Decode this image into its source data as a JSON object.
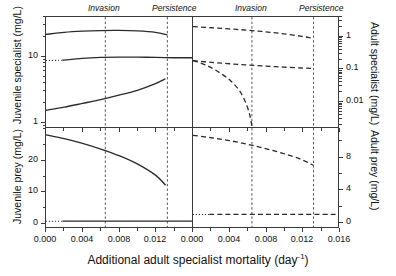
{
  "chart_data": {
    "type": "line",
    "title": "",
    "xlabel": "Additional adult specialist mortality (day−1)",
    "xlabel_base": "Additional adult specialist mortality (day",
    "xlabel_sup": "-1",
    "xlabel_tail": ")",
    "panels": [
      {
        "id": "top-left",
        "ylabel": "Juvenile specialist (mg/L)",
        "yscale": "log",
        "ylim": [
          0.8,
          40
        ],
        "yticks": [
          1,
          10
        ],
        "yticklabels": [
          "1",
          "10"
        ],
        "xlim": [
          0.0,
          0.016
        ],
        "xticks": [
          0.0,
          0.004,
          0.008,
          0.012
        ],
        "xticklabels": [
          "0.000",
          "0.004",
          "0.008",
          "0.012"
        ],
        "grid": false,
        "linestyle": "solid",
        "series": [
          {
            "name": "upper-branch",
            "style": "solid",
            "x": [
              0.0,
              0.002,
              0.004,
              0.006,
              0.008,
              0.01,
              0.012,
              0.0133
            ],
            "y": [
              21.5,
              23.2,
              24.2,
              24.7,
              24.8,
              24.4,
              23.2,
              21.2
            ]
          },
          {
            "name": "middle-branch",
            "style": "solid",
            "x": [
              0.0018,
              0.004,
              0.006,
              0.008,
              0.01,
              0.012,
              0.014,
              0.016
            ],
            "y": [
              8.6,
              9.2,
              9.5,
              9.6,
              9.6,
              9.5,
              9.4,
              9.4
            ]
          },
          {
            "name": "middle-branch-dotted-lead",
            "style": "dotted",
            "x": [
              0.0,
              0.0018
            ],
            "y": [
              8.5,
              8.6
            ]
          },
          {
            "name": "lower-branch",
            "style": "solid",
            "x": [
              0.0,
              0.002,
              0.004,
              0.006,
              0.008,
              0.01,
              0.012,
              0.0131
            ],
            "y": [
              1.45,
              1.62,
              1.85,
              2.12,
              2.48,
              2.95,
              3.75,
              4.45
            ]
          }
        ]
      },
      {
        "id": "top-right",
        "ylabel": "Adult specialist (mg/L)",
        "yscale": "log",
        "ylim": [
          0.0015,
          4
        ],
        "yticks": [
          1,
          0.1,
          0.01
        ],
        "yticklabels": [
          "1",
          "0.1",
          "0.01"
        ],
        "xlim": [
          0.0,
          0.016
        ],
        "xticks": [
          0.0,
          0.004,
          0.008,
          0.012,
          0.016
        ],
        "xticklabels": [
          "0.000",
          "0.004",
          "0.008",
          "0.012",
          "0.016"
        ],
        "grid": false,
        "linestyle": "dashed",
        "series": [
          {
            "name": "upper-branch",
            "style": "dashed",
            "x": [
              0.0,
              0.002,
              0.004,
              0.006,
              0.008,
              0.01,
              0.012,
              0.0133
            ],
            "y": [
              2.0,
              1.85,
              1.7,
              1.55,
              1.38,
              1.2,
              1.0,
              0.86
            ]
          },
          {
            "name": "middle-branch",
            "style": "dashed",
            "x": [
              0.0,
              0.002,
              0.004,
              0.006,
              0.008,
              0.01,
              0.012,
              0.0133
            ],
            "y": [
              0.175,
              0.155,
              0.14,
              0.128,
              0.118,
              0.11,
              0.103,
              0.1
            ]
          },
          {
            "name": "collapsing-branch",
            "style": "dashed",
            "x": [
              0.0,
              0.0015,
              0.003,
              0.0042,
              0.0052,
              0.0059,
              0.0063,
              0.0065
            ],
            "y": [
              0.175,
              0.125,
              0.072,
              0.04,
              0.019,
              0.0075,
              0.0032,
              0.0016
            ]
          }
        ]
      },
      {
        "id": "bottom-left",
        "ylabel": "Juvenile prey (mg/L)",
        "yscale": "linear",
        "ylim": [
          -1.5,
          30
        ],
        "yticks": [
          0,
          10,
          20
        ],
        "yticklabels": [
          "0",
          "10",
          "20"
        ],
        "xlim": [
          0.0,
          0.016
        ],
        "xticks": [
          0.0,
          0.004,
          0.008,
          0.012
        ],
        "xticklabels": [
          "0.000",
          "0.004",
          "0.008",
          "0.012"
        ],
        "grid": false,
        "linestyle": "solid",
        "series": [
          {
            "name": "upper-branch",
            "style": "solid",
            "x": [
              0.0,
              0.002,
              0.004,
              0.006,
              0.008,
              0.01,
              0.012,
              0.0131
            ],
            "y": [
              27.8,
              26.6,
              25.1,
              23.3,
              21.2,
              18.6,
              15.0,
              11.8
            ]
          },
          {
            "name": "near-zero-branch",
            "style": "solid",
            "x": [
              0.0018,
              0.004,
              0.008,
              0.012,
              0.016
            ],
            "y": [
              0.35,
              0.35,
              0.35,
              0.35,
              0.35
            ]
          },
          {
            "name": "near-zero-dotted-lead",
            "style": "dotted",
            "x": [
              0.0,
              0.0018
            ],
            "y": [
              0.35,
              0.35
            ]
          }
        ]
      },
      {
        "id": "bottom-right",
        "ylabel": "Adult prey (mg/L)",
        "yscale": "linear",
        "ylim": [
          -0.7,
          11.5
        ],
        "yticks": [
          0,
          4,
          8
        ],
        "yticklabels": [
          "0",
          "4",
          "8"
        ],
        "xlim": [
          0.0,
          0.016
        ],
        "xticks": [
          0.0,
          0.004,
          0.008,
          0.012,
          0.016
        ],
        "xticklabels": [
          "0.000",
          "0.004",
          "0.008",
          "0.012",
          "0.016"
        ],
        "grid": false,
        "linestyle": "dashed",
        "series": [
          {
            "name": "upper-branch",
            "style": "dashed",
            "x": [
              0.0,
              0.002,
              0.004,
              0.006,
              0.008,
              0.01,
              0.012,
              0.0133
            ],
            "y": [
              10.6,
              10.3,
              9.95,
              9.5,
              8.95,
              8.35,
              7.6,
              6.9
            ]
          },
          {
            "name": "near-zero-branch",
            "style": "dashed",
            "x": [
              0.0018,
              0.004,
              0.008,
              0.012,
              0.016
            ],
            "y": [
              0.85,
              0.85,
              0.85,
              0.85,
              0.85
            ]
          },
          {
            "name": "near-zero-dotted-lead",
            "style": "dotted",
            "x": [
              0.0,
              0.0018
            ],
            "y": [
              0.85,
              0.85
            ]
          }
        ]
      }
    ],
    "annotations": [
      {
        "label": "Invasion",
        "x": 0.0065,
        "style": "vertical-dashed"
      },
      {
        "label": "Persistence",
        "x": 0.0133,
        "style": "vertical-dashed"
      }
    ],
    "annotation_labels": {
      "invasion": "Invasion",
      "persistence": "Persistence"
    }
  }
}
